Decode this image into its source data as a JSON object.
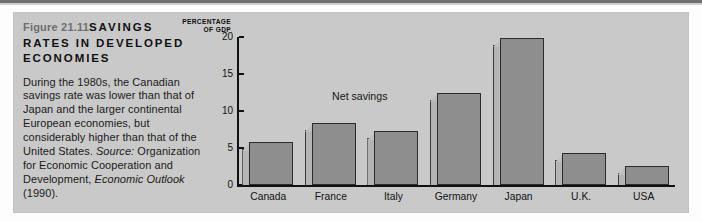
{
  "figure": {
    "number": "Figure 21.11",
    "title": "SAVINGS RATES IN DEVELOPED ECONOMIES",
    "caption": "During the 1980s, the Canadian savings rate was lower than that of Japan and the larger continental European economies, but considerably higher than that of the United States. ",
    "source_label": "Source:",
    "source_text": " Organization for Economic Cooperation and Development, ",
    "source_italic_title": "Economic Outlook",
    "source_year": " (1990)."
  },
  "chart_data": {
    "type": "bar",
    "title": "",
    "axis_header_line1": "PERCENTAGE",
    "axis_header_line2": "OF GDP",
    "categories": [
      "Canada",
      "France",
      "Italy",
      "Germany",
      "Japan",
      "U.K.",
      "USA"
    ],
    "values": [
      5.8,
      8.4,
      7.3,
      12.5,
      19.8,
      4.3,
      2.6
    ],
    "series": [
      {
        "name": "Net savings",
        "values": [
          5.8,
          8.4,
          7.3,
          12.5,
          19.8,
          4.3,
          2.6
        ]
      }
    ],
    "annotations": [
      {
        "text": "Net savings",
        "x": "France-Italy",
        "y": 12.0
      }
    ],
    "xlabel": "",
    "ylabel": "PERCENTAGE OF GDP",
    "ylim": [
      0,
      20
    ],
    "yticks": [
      0,
      5,
      10,
      15,
      20
    ],
    "ytick_labels": [
      "0",
      "5",
      "10",
      "15",
      "20"
    ],
    "grid": false,
    "legend": "none",
    "colors": {
      "panel_background": "#c9c9c9",
      "bar_fill": "#8e8e8e",
      "bar_side_face": "#b4b4b4",
      "bar_outline": "#2b2b2b",
      "axis": "#111111",
      "figure_number_text": "#6e6e6e",
      "body_text": "#1b1b1b"
    }
  }
}
